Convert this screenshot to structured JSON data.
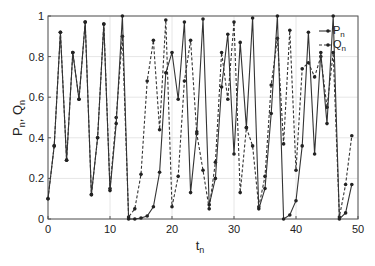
{
  "chart_data": {
    "type": "line",
    "title": "",
    "xlabel": "t",
    "xlabel_sub": "n",
    "ylabel": "P",
    "ylabel_parts": [
      "P",
      "n",
      ", Q",
      "n"
    ],
    "xlim": [
      0,
      50
    ],
    "ylim": [
      0,
      1
    ],
    "xticks": [
      0,
      10,
      20,
      30,
      40,
      50
    ],
    "yticks": [
      0,
      0.2,
      0.4,
      0.6,
      0.8,
      1
    ],
    "ytick_labels": [
      "0",
      "0.2",
      "0.4",
      "0.6",
      "0.8",
      "1"
    ],
    "grid": true,
    "legend_position": "upper right",
    "x": [
      0,
      1,
      2,
      3,
      4,
      5,
      6,
      7,
      8,
      9,
      10,
      11,
      12,
      13,
      14,
      15,
      16,
      17,
      18,
      19,
      20,
      21,
      22,
      23,
      24,
      25,
      26,
      27,
      28,
      29,
      30,
      31,
      32,
      33,
      34,
      35,
      36,
      37,
      38,
      39,
      40,
      41,
      42,
      43,
      44,
      45,
      46,
      47,
      48,
      49
    ],
    "series": [
      {
        "name": "P",
        "sub": "n",
        "style": "solid",
        "color": "#333333",
        "values": [
          0.1,
          0.36,
          0.92,
          0.29,
          0.82,
          0.59,
          0.97,
          0.12,
          0.4,
          0.96,
          0.14,
          0.47,
          1.0,
          0.0,
          0.0,
          0.005,
          0.015,
          0.06,
          0.23,
          0.72,
          0.82,
          0.59,
          0.97,
          0.13,
          0.43,
          0.985,
          0.07,
          0.2,
          0.65,
          0.91,
          0.32,
          0.87,
          0.45,
          0.99,
          0.05,
          0.15,
          0.52,
          1.0,
          0.0,
          0.02,
          0.09,
          0.36,
          0.92,
          0.32,
          0.82,
          0.47,
          1.0,
          0.0,
          0.03,
          0.17
        ]
      },
      {
        "name": "Q",
        "sub": "n",
        "style": "dashed",
        "color": "#333333",
        "values": [
          0.1,
          0.36,
          0.92,
          0.29,
          0.82,
          0.59,
          0.97,
          0.12,
          0.4,
          0.96,
          0.15,
          0.5,
          0.9,
          0.01,
          0.05,
          0.22,
          0.68,
          0.88,
          0.44,
          0.98,
          0.06,
          0.21,
          0.68,
          0.88,
          0.42,
          0.24,
          0.05,
          0.28,
          0.82,
          0.59,
          0.97,
          0.13,
          0.45,
          0.36,
          0.06,
          0.21,
          0.66,
          0.89,
          0.37,
          0.93,
          0.24,
          0.74,
          0.77,
          0.7,
          0.8,
          0.55,
          0.82,
          0.01,
          0.17,
          0.41
        ]
      }
    ]
  }
}
